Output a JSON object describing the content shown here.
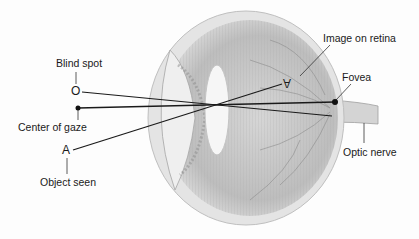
{
  "diagram": {
    "labels": {
      "blind_spot": "Blind spot",
      "center_of_gaze": "Center of gaze",
      "object_seen": "Object seen",
      "image_on_retina": "Image on retina",
      "fovea": "Fovea",
      "optic_nerve": "Optic nerve"
    },
    "symbols": {
      "blind_spot_marker": "O",
      "object_marker": "A",
      "retina_image_marker": "A"
    },
    "colors": {
      "line": "#1a1a1a",
      "eye_gray": "#b8b8b8",
      "background": "#fdfdfd"
    }
  }
}
